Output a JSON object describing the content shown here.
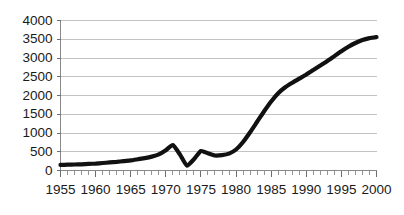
{
  "chart_data": {
    "type": "line",
    "title": "",
    "subtitle": "",
    "xlabel": "",
    "ylabel": "",
    "xlim": [
      1955,
      2000
    ],
    "ylim": [
      0,
      4000
    ],
    "grid": true,
    "legend": false,
    "legend_position": "none",
    "line_color": "#111111",
    "gridline_color": "#b4b4b4",
    "background_color": "#ffffff",
    "y_ticks": [
      0,
      500,
      1000,
      1500,
      2000,
      2500,
      3000,
      3500,
      4000
    ],
    "y_tick_labels": [
      "0",
      "500",
      "1000",
      "1500",
      "2000",
      "2500",
      "3000",
      "3500",
      "4000"
    ],
    "x_ticks": [
      1955,
      1960,
      1965,
      1970,
      1975,
      1980,
      1985,
      1990,
      1995,
      2000
    ],
    "x_tick_labels": [
      "1955",
      "1960",
      "1965",
      "1970",
      "1975",
      "1980",
      "1985",
      "1990",
      "1995",
      "2000"
    ],
    "x_minor_tick_step": 1,
    "series": [
      {
        "name": "series-1",
        "x": [
          1955,
          1956,
          1957,
          1958,
          1959,
          1960,
          1961,
          1962,
          1963,
          1964,
          1965,
          1966,
          1967,
          1968,
          1969,
          1970,
          1971,
          1972,
          1973,
          1974,
          1975,
          1976,
          1977,
          1978,
          1979,
          1980,
          1981,
          1982,
          1983,
          1984,
          1985,
          1986,
          1987,
          1988,
          1989,
          1990,
          1991,
          1992,
          1993,
          1994,
          1995,
          1996,
          1997,
          1998,
          1999,
          2000
        ],
        "values": [
          150,
          155,
          160,
          165,
          175,
          185,
          200,
          215,
          230,
          250,
          270,
          300,
          330,
          370,
          430,
          540,
          680,
          430,
          130,
          300,
          520,
          460,
          400,
          410,
          450,
          560,
          760,
          1020,
          1300,
          1580,
          1840,
          2060,
          2220,
          2340,
          2450,
          2560,
          2680,
          2800,
          2920,
          3050,
          3180,
          3300,
          3400,
          3480,
          3530,
          3560
        ]
      }
    ],
    "annotations": []
  }
}
